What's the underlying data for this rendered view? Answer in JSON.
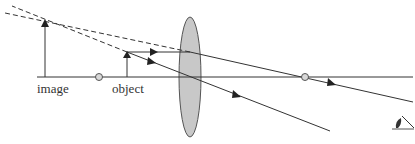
{
  "diagram": {
    "type": "ray-diagram",
    "labels": {
      "image": "image",
      "object": "object"
    },
    "colors": {
      "line": "#333333",
      "lens_fill": "#c8c8c8",
      "lens_stroke": "#555555",
      "focal_fill": "#d8d8d8"
    },
    "elements": {
      "optical_axis": {
        "x1": 37,
        "x2": 413,
        "y": 77
      },
      "lens": {
        "cx": 190,
        "cy": 77,
        "rx": 11,
        "ry": 60
      },
      "object_arrow": {
        "x": 127,
        "base_y": 77,
        "tip_y": 52
      },
      "image_arrow": {
        "x": 45,
        "base_y": 77,
        "tip_y": 20
      },
      "focal_points": [
        {
          "x": 99,
          "y": 77
        },
        {
          "x": 305,
          "y": 77
        }
      ],
      "eye_icon": {
        "x": 395,
        "y": 128
      }
    },
    "rays": [
      {
        "name": "parallel-ray",
        "points": [
          [
            127,
            52
          ],
          [
            190,
            52
          ],
          [
            413,
            102
          ]
        ],
        "style": "solid"
      },
      {
        "name": "central-ray",
        "points": [
          [
            127,
            52
          ],
          [
            330,
            131
          ]
        ],
        "style": "solid"
      },
      {
        "name": "virtual-extension-1",
        "points": [
          [
            190,
            52
          ],
          [
            5,
            13
          ]
        ],
        "style": "dashed"
      },
      {
        "name": "virtual-extension-2",
        "points": [
          [
            127,
            52
          ],
          [
            12,
            6
          ]
        ],
        "style": "dashed"
      }
    ]
  }
}
